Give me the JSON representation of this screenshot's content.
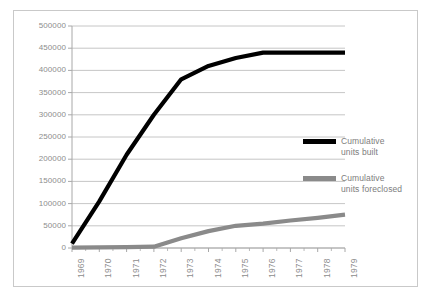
{
  "chart_data": {
    "type": "line",
    "title": "",
    "subtitle": "",
    "xlabel": "",
    "ylabel": "",
    "x": [
      1969,
      1970,
      1971,
      1972,
      1973,
      1974,
      1975,
      1976,
      1977,
      1978,
      1979
    ],
    "xtick_labels": [
      "1969",
      "1970",
      "1971",
      "1972",
      "1973",
      "1974",
      "1975",
      "1976",
      "1977",
      "1978",
      "1979"
    ],
    "ytick_labels": [
      "0",
      "50000",
      "100000",
      "150000",
      "200000",
      "250000",
      "300000",
      "350000",
      "400000",
      "450000",
      "500000"
    ],
    "ytick_values": [
      0,
      50000,
      100000,
      150000,
      200000,
      250000,
      300000,
      350000,
      400000,
      450000,
      500000
    ],
    "ylim": [
      0,
      500000
    ],
    "xlim": [
      1969,
      1979
    ],
    "grid": "horizontal",
    "legend_position": "right",
    "series": [
      {
        "name": "Cumulative units built",
        "label_line1": "Cumulative",
        "label_line2": "units built",
        "color": "#000000",
        "width": 4.2,
        "values": [
          10000,
          105000,
          210000,
          300000,
          380000,
          410000,
          428000,
          440000,
          440000,
          440000,
          440000
        ]
      },
      {
        "name": "Cumulative units foreclosed",
        "label_line1": "Cumulative",
        "label_line2": "units foreclosed",
        "color": "#8a8a8a",
        "width": 4.2,
        "values": [
          1000,
          1500,
          2000,
          3000,
          22000,
          38000,
          50000,
          55000,
          62000,
          68000,
          75000
        ]
      }
    ]
  },
  "style": {
    "grid_color": "#b8b8b8",
    "axis_color": "#a8a8a8",
    "tick_label_color": "#8d8d8d",
    "frame_color": "#c9c9c9",
    "background": "#ffffff"
  }
}
